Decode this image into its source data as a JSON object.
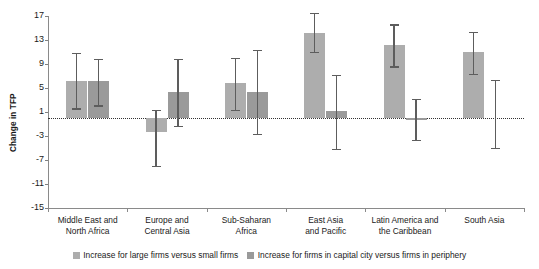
{
  "chart_data": {
    "type": "bar",
    "title": "",
    "xlabel": "",
    "ylabel": "Change in TFP",
    "ylim": [
      -15,
      17
    ],
    "yticks": [
      17,
      13,
      9,
      5,
      1,
      -3,
      -7,
      -11,
      -15
    ],
    "ytick_labels": [
      "17",
      "13",
      "9",
      "5",
      "1",
      "-3",
      "-7",
      "-11",
      "-15"
    ],
    "grid": false,
    "zero_reference_line": 0,
    "legend_position": "bottom",
    "categories": [
      "Middle East and\nNorth Africa",
      "Europe and\nCentral Asia",
      "Sub-Saharan\nAfrica",
      "East Asia\nand Pacific",
      "Latin America and\nthe Caribbean",
      "South Asia"
    ],
    "series": [
      {
        "name": "Increase for large firms versus small firms",
        "color": "#adadad",
        "values": [
          6.1,
          -2.3,
          5.8,
          14.2,
          12.2,
          11.0
        ],
        "ci_low": [
          1.6,
          -8.0,
          1.4,
          11.0,
          8.6,
          7.3
        ],
        "ci_high": [
          10.9,
          1.4,
          10.0,
          17.5,
          15.6,
          14.4
        ]
      },
      {
        "name": "Increase for firms in capital city versus firms in periphery",
        "color": "#9a9a9a",
        "values": [
          6.2,
          4.4,
          4.3,
          1.1,
          -0.3,
          null
        ],
        "ci_low": [
          2.1,
          -1.3,
          -2.6,
          -5.1,
          -3.6,
          -5.0
        ],
        "ci_high": [
          9.9,
          9.9,
          11.3,
          7.2,
          3.2,
          6.4
        ]
      }
    ]
  },
  "legend": {
    "items": [
      {
        "label": "Increase for large firms versus small firms"
      },
      {
        "label": "Increase for firms in capital city versus firms in periphery"
      }
    ]
  }
}
